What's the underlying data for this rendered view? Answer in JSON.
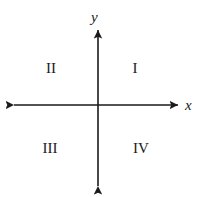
{
  "figure": {
    "type": "cartesian-coordinate-plane",
    "background_color": "#ffffff",
    "stroke_color": "#1a1a1a"
  },
  "axes": {
    "x_label": "x",
    "y_label": "y",
    "origin": {
      "x": 98,
      "y": 105
    },
    "x_axis": {
      "start_x": 14,
      "end_x": 178,
      "y": 105,
      "arrows": "both"
    },
    "y_axis": {
      "x": 98,
      "start_y": 30,
      "end_y": 186,
      "arrows": "both"
    }
  },
  "quadrants": [
    {
      "id": "I",
      "label": "I",
      "position": "upper-right"
    },
    {
      "id": "II",
      "label": "II",
      "position": "upper-left"
    },
    {
      "id": "III",
      "label": "III",
      "position": "lower-left"
    },
    {
      "id": "IV",
      "label": "IV",
      "position": "lower-right"
    }
  ]
}
